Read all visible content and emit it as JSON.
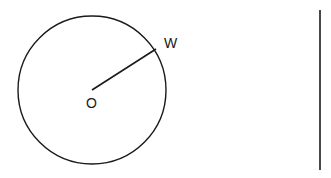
{
  "diagram": {
    "circle": {
      "center_label": "O",
      "point_label": "W"
    },
    "segment": {
      "from": "O",
      "to": "W",
      "type": "radius"
    },
    "separate_line": {
      "orientation": "vertical"
    },
    "colors": {
      "stroke": "#1a1a1a",
      "background": "#ffffff"
    }
  }
}
